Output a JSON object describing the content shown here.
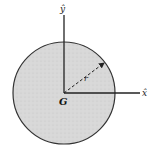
{
  "diagram": {
    "title": "",
    "disk": {
      "fill": "#d9d9d9",
      "stroke": "#333333"
    },
    "labels": {
      "y_axis": "ŷ",
      "x_axis": "x̂",
      "radius": "r",
      "centroid": "G"
    }
  }
}
